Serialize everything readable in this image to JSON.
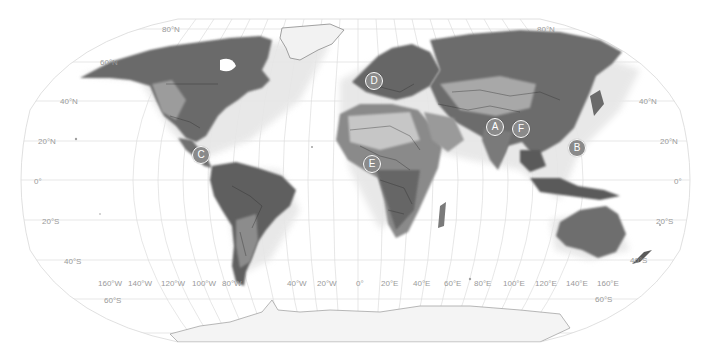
{
  "map": {
    "projection": "Robinson",
    "style": "grayscale shaded relief with country borders",
    "colors": {
      "ocean": "#ffffff",
      "land_dark": "#5a5a5a",
      "land_light": "#bdbdbd",
      "ice": "#f4f4f4",
      "graticule": "#d6d6d6",
      "label": "#9a9a9a",
      "marker_fill": "#8a8a8a",
      "marker_border": "#ffffff"
    },
    "latitude_labels_left": [
      {
        "text": "80°N",
        "x": 170,
        "y": 30
      },
      {
        "text": "60°N",
        "x": 108,
        "y": 63
      },
      {
        "text": "40°N",
        "x": 67,
        "y": 103
      },
      {
        "text": "20°N",
        "x": 46,
        "y": 143
      },
      {
        "text": "0°",
        "x": 38,
        "y": 182
      },
      {
        "text": "20°S",
        "x": 48,
        "y": 222
      },
      {
        "text": "40°S",
        "x": 73,
        "y": 262
      },
      {
        "text": "60°S",
        "x": 112,
        "y": 301
      }
    ],
    "latitude_labels_right": [
      {
        "text": "80°N",
        "x": 545,
        "y": 30
      },
      {
        "text": "40°N",
        "x": 648,
        "y": 102
      },
      {
        "text": "20°N",
        "x": 669,
        "y": 143
      },
      {
        "text": "0°",
        "x": 677,
        "y": 182
      },
      {
        "text": "20°S",
        "x": 665,
        "y": 222
      },
      {
        "text": "40°S",
        "x": 638,
        "y": 261
      },
      {
        "text": "60°S",
        "x": 595,
        "y": 300
      }
    ],
    "longitude_labels": [
      {
        "text": "160°W",
        "x": 109,
        "y": 284
      },
      {
        "text": "140°W",
        "x": 139,
        "y": 284
      },
      {
        "text": "120°W",
        "x": 172,
        "y": 284
      },
      {
        "text": "100°W",
        "x": 203,
        "y": 284
      },
      {
        "text": "80°W",
        "x": 232,
        "y": 284
      },
      {
        "text": "40°W",
        "x": 295,
        "y": 284
      },
      {
        "text": "20°W",
        "x": 326,
        "y": 284
      },
      {
        "text": "0°",
        "x": 358,
        "y": 284
      },
      {
        "text": "20°E",
        "x": 389,
        "y": 284
      },
      {
        "text": "40°E",
        "x": 420,
        "y": 284
      },
      {
        "text": "60°E",
        "x": 451,
        "y": 284
      },
      {
        "text": "80°E",
        "x": 481,
        "y": 284
      },
      {
        "text": "100°E",
        "x": 512,
        "y": 284
      },
      {
        "text": "120°E",
        "x": 544,
        "y": 284
      },
      {
        "text": "140°E",
        "x": 574,
        "y": 284
      },
      {
        "text": "160°E",
        "x": 605,
        "y": 284
      }
    ],
    "markers": [
      {
        "label": "A",
        "region": "South Asia (India/Nepal)",
        "x": 495,
        "y": 127
      },
      {
        "label": "B",
        "region": "Taiwan / Philippines",
        "x": 577,
        "y": 148
      },
      {
        "label": "C",
        "region": "Central America",
        "x": 201,
        "y": 155
      },
      {
        "label": "D",
        "region": "Western Europe",
        "x": 374,
        "y": 81
      },
      {
        "label": "E",
        "region": "West Africa (Gulf of Guinea)",
        "x": 372,
        "y": 164
      },
      {
        "label": "F",
        "region": "Bangladesh / Northeast India",
        "x": 521,
        "y": 129
      }
    ]
  }
}
